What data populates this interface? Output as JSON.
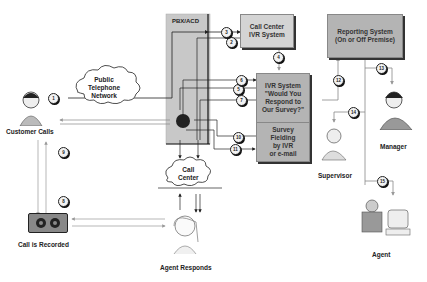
{
  "diagram": {
    "nodes": {
      "pbx": {
        "label": "PBX/ACD"
      },
      "call_center_ivr": {
        "line1": "Call Center",
        "line2": "IVR System"
      },
      "ivr_survey": {
        "line1": "IVR System",
        "line2": "\"Would You",
        "line3": "Respond to",
        "line4": "Our Survey?\""
      },
      "survey_fielding": {
        "line1": "Survey",
        "line2": "Fielding",
        "line3": "by IVR",
        "line4": "or e-mail"
      },
      "reporting": {
        "line1": "Reporting System",
        "line2": "(On or Off Premise)"
      },
      "pstn": {
        "line1": "Public",
        "line2": "Telephone",
        "line3": "Network"
      },
      "call_center_cloud": {
        "line1": "Call",
        "line2": "Center"
      },
      "customer": {
        "label": "Customer Calls"
      },
      "recorder": {
        "label": "Call is Recorded"
      },
      "agent_responds": {
        "label": "Agent Responds"
      },
      "supervisor": {
        "label": "Supervisor"
      },
      "manager": {
        "label": "Manager"
      },
      "agent": {
        "label": "Agent"
      }
    },
    "steps": [
      "1",
      "2",
      "3",
      "4",
      "5",
      "6",
      "7",
      "8",
      "9",
      "10",
      "11",
      "12",
      "13",
      "14",
      "15"
    ],
    "colors": {
      "box": "#b4b4b4",
      "box_light": "#d4d4d4",
      "pbx_fill": "#c8c8c8",
      "line": "#222222",
      "gray_line": "#999999"
    }
  }
}
